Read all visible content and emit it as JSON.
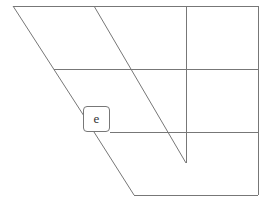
{
  "diagram": {
    "line_color": "#777777",
    "lines": [
      {
        "id": "top-edge",
        "x1": 13,
        "y1": 6,
        "x2": 258,
        "y2": 6
      },
      {
        "id": "right-edge",
        "x1": 258,
        "y1": 6,
        "x2": 258,
        "y2": 195
      },
      {
        "id": "bottom-edge",
        "x1": 134,
        "y1": 195,
        "x2": 258,
        "y2": 195
      },
      {
        "id": "left-diagonal-upper",
        "x1": 13,
        "y1": 6,
        "x2": 84,
        "y2": 116
      },
      {
        "id": "left-diagonal-lower",
        "x1": 94,
        "y1": 132,
        "x2": 134,
        "y2": 195
      },
      {
        "id": "middle-diagonal",
        "x1": 94,
        "y1": 6,
        "x2": 186,
        "y2": 163
      },
      {
        "id": "vertical-line",
        "x1": 186,
        "y1": 6,
        "x2": 186,
        "y2": 163
      },
      {
        "id": "horizontal-mid",
        "x1": 54,
        "y1": 69,
        "x2": 258,
        "y2": 69
      },
      {
        "id": "horizontal-lower",
        "x1": 110,
        "y1": 132,
        "x2": 258,
        "y2": 132
      }
    ],
    "nodes": [
      {
        "id": "e",
        "label": "e",
        "x": 83,
        "y": 106,
        "w": 27,
        "h": 26
      }
    ]
  }
}
